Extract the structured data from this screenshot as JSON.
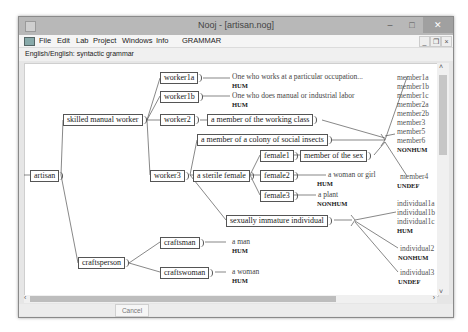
{
  "window": {
    "title": "Nooj - [artisan.nog]",
    "controls": {
      "minimize": "–",
      "maximize": "□",
      "close": "✕"
    },
    "mdi_controls": {
      "minimize": "_",
      "restore": "❐",
      "close": "×"
    }
  },
  "menu": {
    "items": [
      "File",
      "Edit",
      "Lab",
      "Project",
      "Windows",
      "Info",
      "GRAMMAR"
    ]
  },
  "header": {
    "text": "English/English: syntactic grammar"
  },
  "graph": {
    "root": "artisan",
    "nodes": {
      "skilled": "skilled manual worker",
      "craftsperson": "craftsperson",
      "worker1a": "worker1a",
      "worker1b": "worker1b",
      "worker2": "worker2",
      "worker3": "worker3",
      "working_class": "a member of the working class",
      "colony": "a member of a colony of social insects",
      "sterile_female": "a sterile female",
      "female1": "female1",
      "female2": "female2",
      "female3": "female3",
      "member_of_sex": "member of the sex",
      "immature": "sexually immature individual",
      "craftsman": "craftsman",
      "craftswoman": "craftswoman"
    },
    "glosses": {
      "worker1a": {
        "text": "One who works at a particular occupation...",
        "tag": "HUM"
      },
      "worker1b": {
        "text": "One who does manual or industrial labor",
        "tag": "HUM"
      },
      "female2": {
        "text": "a woman or girl",
        "tag": "HUM"
      },
      "female3": {
        "text": "a plant",
        "tag": "NONHUM"
      },
      "craftsman": {
        "text": "a man",
        "tag": "HUM"
      },
      "craftswoman": {
        "text": "a woman",
        "tag": "HUM"
      }
    },
    "member_group": {
      "items": [
        "member1a",
        "member1b",
        "member1c",
        "member2a",
        "member2b",
        "member3",
        "member5",
        "member6"
      ],
      "tag": "NONHUM"
    },
    "member4": {
      "text": "member4",
      "tag": "UNDEF"
    },
    "individual_group": {
      "items": [
        "individual1a",
        "individual1b",
        "individual1c"
      ],
      "tag": "HUM"
    },
    "individual2": {
      "text": "individual2",
      "tag": "NONHUM"
    },
    "individual3": {
      "text": "individual3",
      "tag": "UNDEF"
    }
  },
  "footer": {
    "cancel_label": "Cancel"
  },
  "scroll": {
    "up": "˄",
    "down": "˅",
    "left": "‹",
    "right": "›"
  }
}
